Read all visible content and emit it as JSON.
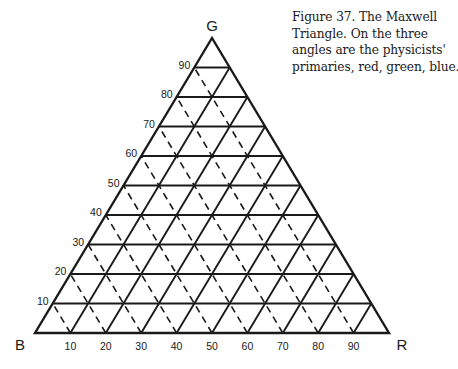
{
  "caption": {
    "lines": [
      "Figure 37. The Maxwell",
      "Triangle. On the three",
      "angles are the physicists'",
      "primaries, red, green, blue."
    ]
  },
  "diagram": {
    "type": "ternary-triangle",
    "title": "The Maxwell Triangle",
    "vertices": {
      "top": "G",
      "bottom_left": "B",
      "bottom_right": "R"
    },
    "left_axis_labels": [
      "10",
      "20",
      "30",
      "40",
      "50",
      "60",
      "70",
      "80",
      "90"
    ],
    "bottom_axis_labels": [
      "10",
      "20",
      "30",
      "40",
      "50",
      "60",
      "70",
      "80",
      "90"
    ],
    "grid": {
      "divisions": 10,
      "horizontal_lines": "solid",
      "lines_parallel_to_left_edge": "solid",
      "lines_parallel_to_right_edge": "dashed"
    },
    "line_color": "#1a1a1a"
  }
}
